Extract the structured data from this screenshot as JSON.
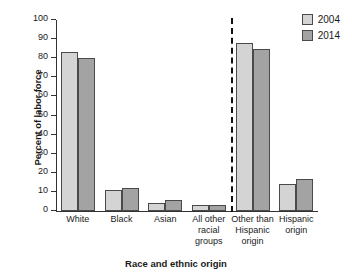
{
  "chart_data": {
    "type": "bar",
    "title": "",
    "xlabel": "Race and ethnic origin",
    "ylabel": "Percent of labor force",
    "ylim": [
      0,
      100
    ],
    "ytick_step": 10,
    "yticks": [
      0,
      10,
      20,
      30,
      40,
      50,
      60,
      70,
      80,
      90,
      100
    ],
    "grid": false,
    "legend_position": "top-right",
    "categories": [
      "White",
      "Black",
      "Asian",
      "All other racial groups",
      "Other than Hispanic origin",
      "Hispanic origin"
    ],
    "category_lines": [
      [
        "White"
      ],
      [
        "Black"
      ],
      [
        "Asian"
      ],
      [
        "All other",
        "racial",
        "groups"
      ],
      [
        "Other than",
        "Hispanic",
        "origin"
      ],
      [
        "Hispanic",
        "origin"
      ]
    ],
    "series": [
      {
        "name": "2004",
        "color": "#d4d4d4",
        "values": [
          83,
          11,
          4,
          3,
          88,
          14
        ]
      },
      {
        "name": "2014",
        "color": "#a3a3a3",
        "values": [
          80,
          12,
          6,
          3,
          85,
          17
        ]
      }
    ],
    "annotations": [
      {
        "type": "vertical-dashed-divider",
        "between": [
          "All other racial groups",
          "Other than Hispanic origin"
        ]
      }
    ]
  },
  "legend": {
    "items": [
      {
        "label": "2004",
        "color": "#d4d4d4"
      },
      {
        "label": "2014",
        "color": "#a3a3a3"
      }
    ]
  },
  "colors": {
    "series_2004": "#d4d4d4",
    "series_2014": "#a3a3a3",
    "axis": "#333333",
    "background": "#ffffff"
  }
}
